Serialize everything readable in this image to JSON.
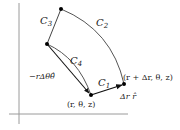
{
  "diagram": {
    "labels": {
      "c1": "C",
      "c1_sub": "1",
      "c2": "C",
      "c2_sub": "2",
      "c3": "C",
      "c3_sub": "3",
      "c4": "C",
      "c4_sub": "4",
      "origin_point": "(r, θ, z)",
      "radial_point": "(r + Δr, θ, z)",
      "radial_vector": "Δr r̂",
      "angular_vector": "−rΔθθ̂"
    },
    "colors": {
      "axis": "#999999",
      "curve": "#444444",
      "vector": "#111111",
      "point": "#000000"
    }
  }
}
